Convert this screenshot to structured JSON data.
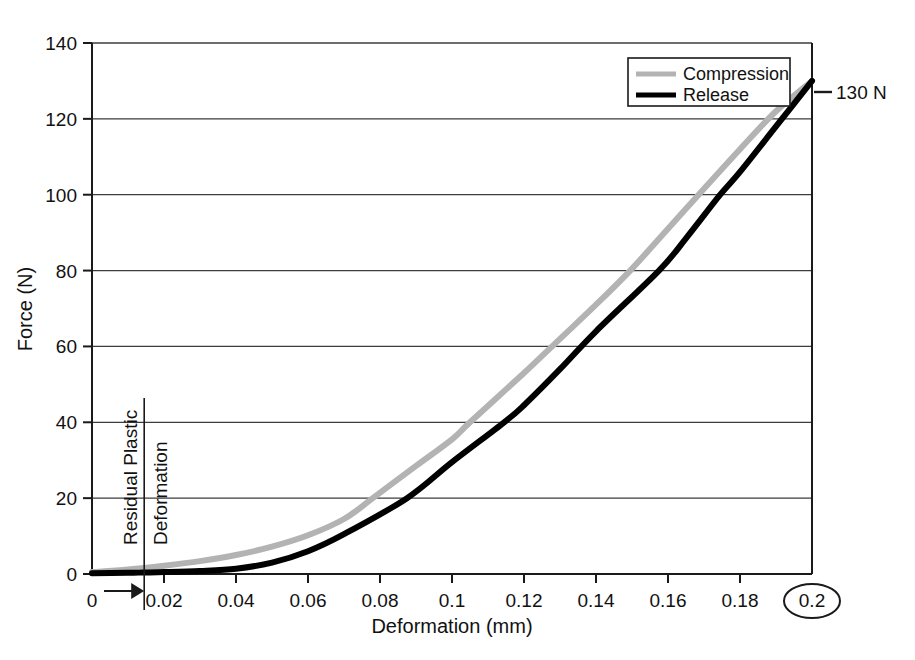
{
  "chart_data": {
    "type": "line",
    "title": "",
    "xlabel": "Deformation (mm)",
    "ylabel": "Force (N)",
    "xlim": [
      0,
      0.2
    ],
    "ylim": [
      0,
      140
    ],
    "grid": "horizontal",
    "legend_position": "top-right",
    "x_ticks": [
      "0",
      "0.02",
      "0.04",
      "0.06",
      "0.08",
      "0.1",
      "0.12",
      "0.14",
      "0.16",
      "0.18",
      "0.2"
    ],
    "x_tick_values": [
      0,
      0.02,
      0.04,
      0.06,
      0.08,
      0.1,
      0.12,
      0.14,
      0.16,
      0.18,
      0.2
    ],
    "y_ticks": [
      "0",
      "20",
      "40",
      "60",
      "80",
      "100",
      "120",
      "140"
    ],
    "y_tick_values": [
      0,
      20,
      40,
      60,
      80,
      100,
      120,
      140
    ],
    "series": [
      {
        "name": "Compression",
        "color": "#b3b3b3",
        "x": [
          0,
          0.01,
          0.02,
          0.03,
          0.04,
          0.05,
          0.06,
          0.07,
          0.078,
          0.09,
          0.1,
          0.105,
          0.12,
          0.13,
          0.14,
          0.1495,
          0.16,
          0.1685,
          0.18,
          0.19,
          0.2
        ],
        "values": [
          0.5,
          1.2,
          2.2,
          3.4,
          5.0,
          7.2,
          10.2,
          14.5,
          20.0,
          28.5,
          35.5,
          40.0,
          53.0,
          62.0,
          71.0,
          80.0,
          91.0,
          100.0,
          112.0,
          122.0,
          130.0
        ]
      },
      {
        "name": "Release",
        "color": "#000000",
        "x": [
          0,
          0.01,
          0.0145,
          0.02,
          0.03,
          0.04,
          0.05,
          0.06,
          0.07,
          0.0875,
          0.1,
          0.1145,
          0.12,
          0.13,
          0.14,
          0.1575,
          0.165,
          0.1745,
          0.18,
          0.19,
          0.2
        ],
        "values": [
          0.2,
          0.3,
          0.4,
          0.5,
          0.8,
          1.4,
          3.0,
          6.0,
          10.5,
          20.0,
          29.5,
          40.0,
          44.5,
          54.0,
          64.0,
          80.0,
          88.5,
          100.0,
          106.0,
          118.0,
          130.0
        ]
      }
    ],
    "annotations": {
      "peak_force": {
        "text": "130 N",
        "x": 0.2,
        "y": 130
      },
      "residual_plastic_deformation": {
        "line_1": "Residual Plastic",
        "line_2": "Deformation",
        "x_marker": 0.0145,
        "arrow_from": 0,
        "arrow_to": 0.0145
      },
      "circled_tick": "0.2"
    }
  },
  "legend": {
    "items": [
      {
        "label": "Compression",
        "color": "#b3b3b3"
      },
      {
        "label": "Release",
        "color": "#000000"
      }
    ]
  }
}
